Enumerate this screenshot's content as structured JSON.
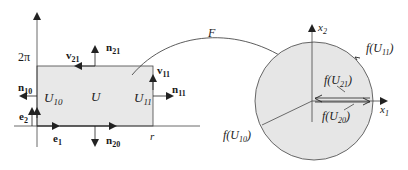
{
  "diagram": {
    "type": "domain-mapping",
    "colors": {
      "fill": "#e8e8e8",
      "stroke": "#333333",
      "text": "#1a1a1a"
    },
    "left_domain": {
      "y_tick_label": "2π",
      "x_tick_label": "r",
      "region_label": "U",
      "boundary_labels": {
        "left": "U",
        "left_sub": "10",
        "right": "U",
        "right_sub": "11"
      },
      "normals": [
        {
          "name": "n",
          "sub": "10"
        },
        {
          "name": "n",
          "sub": "11"
        },
        {
          "name": "n",
          "sub": "20"
        },
        {
          "name": "n",
          "sub": "21"
        }
      ],
      "tangents": [
        {
          "name": "v",
          "sub": "11"
        },
        {
          "name": "v",
          "sub": "21"
        }
      ],
      "basis": [
        {
          "name": "e",
          "sub": "1"
        },
        {
          "name": "e",
          "sub": "2"
        }
      ]
    },
    "map_label": "F",
    "right_domain": {
      "axis_x": {
        "name": "x",
        "sub": "1"
      },
      "axis_y": {
        "name": "x",
        "sub": "2"
      },
      "images": [
        {
          "prefix": "f(U",
          "sub": "10",
          "suffix": ")"
        },
        {
          "prefix": "f(U",
          "sub": "11",
          "suffix": ")"
        },
        {
          "prefix": "f(U",
          "sub": "20",
          "suffix": ")"
        },
        {
          "prefix": "f(U",
          "sub": "21",
          "suffix": ")"
        }
      ]
    }
  }
}
